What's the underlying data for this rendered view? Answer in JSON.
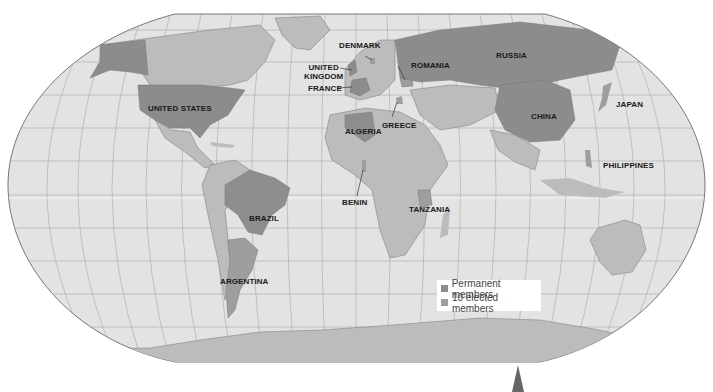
{
  "map": {
    "title": "UN Security Council members world map",
    "colors": {
      "ocean": "#e3e3e3",
      "land": "#bcbcbc",
      "permanent": "#8c8c8c",
      "elected": "#9e9e9e",
      "graticule": "#a8a8a8",
      "label": "#1a1a1a"
    },
    "labels": {
      "united_states": "UNITED STATES",
      "russia": "RUSSIA",
      "china": "CHINA",
      "japan": "JAPAN",
      "philippines": "PHILIPPINES",
      "denmark": "DENMARK",
      "united_kingdom_1": "UNITED",
      "united_kingdom_2": "KINGDOM",
      "france": "FRANCE",
      "romania": "ROMANIA",
      "algeria": "ALGERIA",
      "greece": "GREECE",
      "benin": "BENIN",
      "tanzania": "TANZANIA",
      "brazil": "BRAZIL",
      "argentina": "ARGENTINA"
    },
    "legend": {
      "items": [
        {
          "label": "Permanent members",
          "color": "#8c8c8c"
        },
        {
          "label": "10 elected members",
          "color": "#9e9e9e"
        }
      ]
    }
  }
}
